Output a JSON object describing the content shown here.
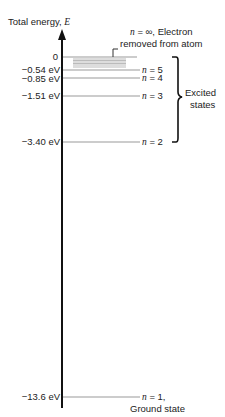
{
  "diagram": {
    "axis_label_prefix": "Total energy, ",
    "axis_label_symbol": "E",
    "top_label": {
      "line1_var": "n",
      "line1_rest": " = ∞, Electron",
      "line2": "removed from atom"
    },
    "bracket_label": {
      "line1": "Excited",
      "line2": "states"
    },
    "ground_label": "Ground state",
    "levels": [
      {
        "energy": "0",
        "n_label": ""
      },
      {
        "energy": "−0.54 eV",
        "n_label": "= 5"
      },
      {
        "energy": "−0.85 eV",
        "n_label": "= 4"
      },
      {
        "energy": "−1.51 eV",
        "n_label": "= 3"
      },
      {
        "energy": "−3.40 eV",
        "n_label": "= 2"
      },
      {
        "energy": "−13.6 eV",
        "n_label": "= 1,"
      }
    ],
    "n_symbol": "n",
    "colors": {
      "axis": "#111111",
      "level": "#9a9a9a",
      "text": "#222222"
    }
  }
}
